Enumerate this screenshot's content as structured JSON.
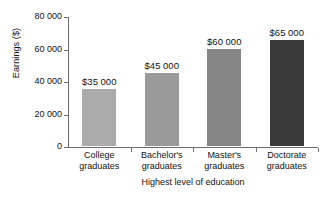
{
  "chart_data": {
    "type": "bar",
    "title": "",
    "xlabel": "Highest level of education",
    "ylabel": "Earnings ($)",
    "categories": [
      "College graduates",
      "Bachelor's graduates",
      "Master's graduates",
      "Doctorate graduates"
    ],
    "category_lines": [
      [
        "College",
        "graduates"
      ],
      [
        "Bachelor's",
        "graduates"
      ],
      [
        "Master's",
        "graduates"
      ],
      [
        "Doctorate",
        "graduates"
      ]
    ],
    "values": [
      35000,
      45000,
      60000,
      65000
    ],
    "value_labels": [
      "$35 000",
      "$45 000",
      "$60 000",
      "$65 000"
    ],
    "bar_colors": [
      "#ababab",
      "#9a9a9a",
      "#868686",
      "#3a3a3a"
    ],
    "ylim": [
      0,
      80000
    ],
    "yticks": [
      0,
      20000,
      40000,
      60000,
      80000
    ],
    "ytick_labels": [
      "0",
      "20 000",
      "40 000",
      "60 000",
      "80 000"
    ],
    "grid": false,
    "legend": "none",
    "background_color": "#ffffff",
    "axis_color": "#6f6f6f"
  }
}
